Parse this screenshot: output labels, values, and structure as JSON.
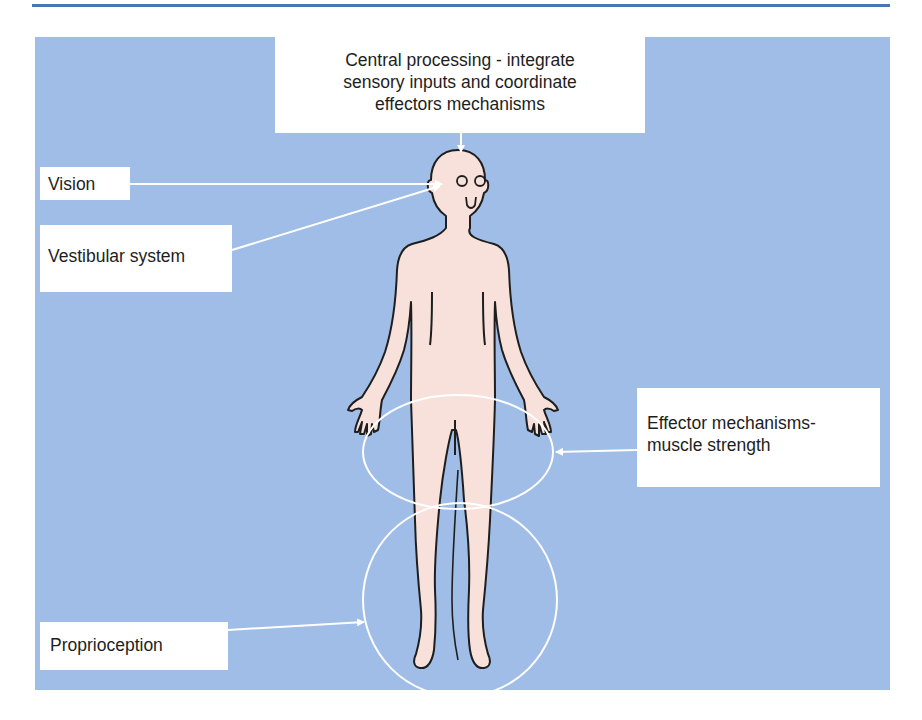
{
  "diagram": {
    "type": "anatomical-labelled-diagram",
    "colors": {
      "top_rule": "#4a74b8",
      "panel_background": "#9fbde6",
      "label_box": "#ffffff",
      "body_fill": "#f7e1da",
      "body_outline": "#1e1e1e",
      "annotation_lines": "#ffffff"
    },
    "labels": {
      "central": {
        "line1": "Central processing - integrate",
        "line2": "sensory inputs and coordinate",
        "line3": "effectors mechanisms"
      },
      "vision": "Vision",
      "vestibular": "Vestibular system",
      "effector": {
        "line1": "Effector mechanisms-",
        "line2": "muscle strength"
      },
      "proprioception": "Proprioception"
    },
    "annotations": [
      {
        "label": "Central processing",
        "target": "top of head",
        "shape": "arrow"
      },
      {
        "label": "Vision",
        "target": "eyes",
        "shape": "arrow"
      },
      {
        "label": "Vestibular system",
        "target": "ear/head",
        "shape": "arrow"
      },
      {
        "label": "Effector mechanisms-muscle strength",
        "target": "hips/thighs",
        "shape": "ellipse + arrow"
      },
      {
        "label": "Proprioception",
        "target": "legs/feet",
        "shape": "circle + arrow"
      }
    ]
  }
}
